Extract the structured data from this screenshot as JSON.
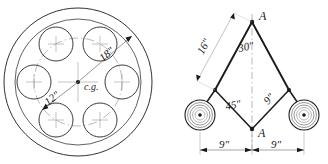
{
  "sheet": {
    "background_color": "#ffffff",
    "ink_color": "#1a1a1a",
    "construction_color": "#9a9a9a"
  },
  "figures": [
    {
      "id": "flywheel",
      "name": "flywheel-with-six-holes",
      "type": "mechanical-section-view",
      "center_marker_label": "c.g.",
      "hole_count": 6,
      "dimensions": [
        {
          "label": "12\"",
          "name": "bolt-circle-radius-dimension",
          "direction": "lower-left"
        },
        {
          "label": "18\"",
          "name": "outer-radius-dimension",
          "direction": "upper-right"
        }
      ]
    },
    {
      "id": "linkage",
      "name": "bell-crank-linkage",
      "type": "kinematic-diagram",
      "vertex_labels": [
        "A",
        "A"
      ],
      "angles": [
        {
          "label": "30\"",
          "name": "apex-angle-label"
        },
        {
          "label": "45\"",
          "name": "lower-angle-label"
        }
      ],
      "link_dimensions": [
        {
          "label": "16\"",
          "name": "upper-left-link-dimension"
        },
        {
          "label": "9\"",
          "name": "lower-right-link-dimension"
        }
      ],
      "base_dimensions": [
        {
          "label": "9\"",
          "name": "base-dimension-left"
        },
        {
          "label": "9\"",
          "name": "base-dimension-right"
        }
      ],
      "roller_count": 2
    }
  ]
}
